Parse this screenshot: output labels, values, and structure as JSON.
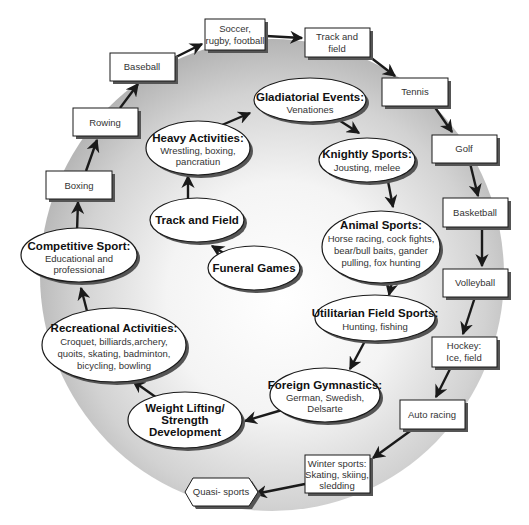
{
  "diagram": {
    "type": "cycle-diagram",
    "outer_ring_label": "Modern sports",
    "outer_boxes": [
      {
        "id": "soccer",
        "lines": [
          "Soccer,",
          "rugby, football"
        ]
      },
      {
        "id": "track-field-box",
        "lines": [
          "Track and",
          "field"
        ]
      },
      {
        "id": "tennis",
        "lines": [
          "Tennis"
        ]
      },
      {
        "id": "golf",
        "lines": [
          "Golf"
        ]
      },
      {
        "id": "basketball",
        "lines": [
          "Basketball"
        ]
      },
      {
        "id": "volleyball",
        "lines": [
          "Volleyball"
        ]
      },
      {
        "id": "hockey",
        "lines": [
          "Hockey:",
          "Ice, field"
        ]
      },
      {
        "id": "auto-racing",
        "lines": [
          "Auto racing"
        ]
      },
      {
        "id": "winter-sports",
        "lines": [
          "Winter sports:",
          "Skating, skiing,",
          "sledding"
        ]
      },
      {
        "id": "baseball",
        "lines": [
          "Baseball"
        ]
      },
      {
        "id": "rowing",
        "lines": [
          "Rowing"
        ]
      },
      {
        "id": "boxing",
        "lines": [
          "Boxing"
        ]
      }
    ],
    "terminal": {
      "id": "quasi-sports",
      "lines": [
        "Quasi- sports"
      ],
      "shape": "hexagon"
    },
    "ellipses": [
      {
        "id": "funeral-games",
        "title": [
          "Funeral Games"
        ],
        "sub": []
      },
      {
        "id": "track-and-field",
        "title": [
          "Track and Field"
        ],
        "sub": []
      },
      {
        "id": "heavy-activities",
        "title": [
          "Heavy Activities:"
        ],
        "sub": [
          "Wrestling, boxing,",
          "pancratiun"
        ]
      },
      {
        "id": "gladiatorial-events",
        "title": [
          "Gladiatorial Events:"
        ],
        "sub": [
          "Venationes"
        ]
      },
      {
        "id": "knightly-sports",
        "title": [
          "Knightly Sports:"
        ],
        "sub": [
          "Jousting, melee"
        ]
      },
      {
        "id": "animal-sports",
        "title": [
          "Animal Sports:"
        ],
        "sub": [
          "Horse racing, cock fights,",
          "bear/bull baits, gander",
          "pulling, fox hunting"
        ]
      },
      {
        "id": "utilitarian-field-sports",
        "title": [
          "Utilitarian Field Sports:"
        ],
        "sub": [
          "Hunting, fishing"
        ]
      },
      {
        "id": "foreign-gymnastics",
        "title": [
          "Foreign Gymnastics:"
        ],
        "sub": [
          "German, Swedish,",
          "Delsarte"
        ]
      },
      {
        "id": "weight-lifting",
        "title": [
          "Weight Lifting/",
          "Strength",
          "Development"
        ],
        "sub": []
      },
      {
        "id": "recreational-activities",
        "title": [
          "Recreational Activities:"
        ],
        "sub": [
          "Croquet, billiards,archery,",
          "quoits, skating, badminton,",
          "bicycling, bowling"
        ]
      },
      {
        "id": "competitive-sport",
        "title": [
          "Competitive Sport:"
        ],
        "sub": [
          "Educational and",
          "professional"
        ]
      }
    ],
    "flow": [
      "Funeral Games",
      "Track and Field",
      "Heavy Activities",
      "Gladiatorial Events",
      "Knightly Sports",
      "Animal Sports",
      "Utilitarian Field Sports",
      "Foreign Gymnastics",
      "Weight Lifting/Strength Development",
      "Recreational Activities",
      "Competitive Sport",
      "Boxing",
      "Rowing",
      "Baseball",
      "Soccer, rugby, football",
      "Track and field",
      "Tennis",
      "Golf",
      "Basketball",
      "Volleyball",
      "Hockey",
      "Auto racing",
      "Winter sports",
      "Quasi- sports"
    ],
    "colors": {
      "stroke": "#1a1a1a",
      "fill": "#ffffff",
      "shadow": "#555555",
      "ring_gradient_outer": "#b8b8b8",
      "ring_gradient_inner": "#ffffff"
    }
  }
}
